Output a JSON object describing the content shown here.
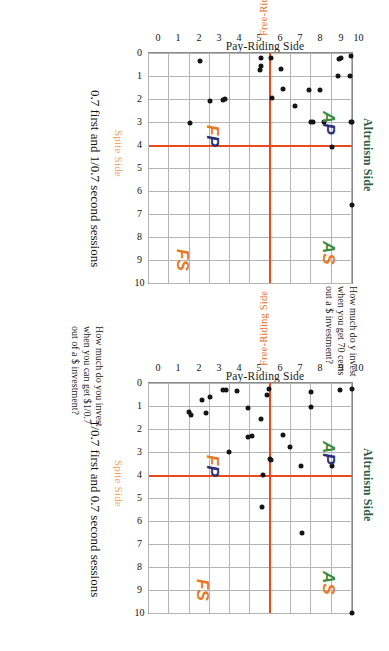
{
  "figure": {
    "type": "scatter-panels",
    "panel_count": 2,
    "background": "#ffffff"
  },
  "colors": {
    "reference_line": "#e8491d",
    "altruism": "#2f5d3f",
    "free_riding": "#e8701c",
    "spite": "#efa26a",
    "quadrant_green": "#3a8a3a",
    "quadrant_blue": "#2b2f77",
    "quadrant_orange": "#e8791f",
    "point": "#151515",
    "gridline": "#b4b4b4"
  },
  "panels": [
    {
      "id": "panel-top",
      "caption": "How much do y invest when you get 70 cents out a $ investment?",
      "subcaption": "0.7 first and 1/0.7 second sessions",
      "axis_titles": {
        "top": "Altruism Side",
        "left": "Pay-Riding Side",
        "bottom_x": "Spite Side",
        "right_y": "Free-Riding Side"
      },
      "quadrant_labels": [
        {
          "name": "AP",
          "first": "A",
          "first_color": "green",
          "second": "P",
          "second_color": "blue"
        },
        {
          "name": "AS",
          "first": "A",
          "first_color": "green",
          "second": "S",
          "second_color": "orange"
        },
        {
          "name": "FP",
          "first": "F",
          "first_color": "orange",
          "second": "P",
          "second_color": "blue"
        },
        {
          "name": "FS",
          "first": "F",
          "first_color": "orange",
          "second": "S",
          "second_color": "orange"
        }
      ],
      "chart_data": {
        "type": "scatter",
        "title": "0.7 first and 1/0.7 second sessions",
        "xlabel": "Spite Side",
        "ylabel": "Free-Riding Side",
        "xlim": [
          0,
          10
        ],
        "ylim": [
          0,
          10
        ],
        "xticks": [
          0,
          1,
          2,
          3,
          4,
          5,
          6,
          7,
          8,
          9,
          10
        ],
        "yticks": [
          0,
          1,
          2,
          3,
          4,
          5,
          6,
          7,
          8,
          9,
          10
        ],
        "grid": true,
        "legend": "none",
        "reference_lines": {
          "x": 4,
          "y": 6
        },
        "points": [
          [
            6.6,
            10.0
          ],
          [
            4.1,
            9.0
          ],
          [
            3.0,
            10.0
          ],
          [
            3.0,
            9.95
          ],
          [
            3.0,
            8.6
          ],
          [
            3.0,
            8.1
          ],
          [
            3.0,
            8.0
          ],
          [
            2.3,
            7.2
          ],
          [
            3.05,
            2.0
          ],
          [
            2.1,
            3.0
          ],
          [
            1.0,
            9.9
          ],
          [
            1.0,
            9.3
          ],
          [
            1.6,
            8.4
          ],
          [
            1.6,
            7.9
          ],
          [
            1.55,
            6.6
          ],
          [
            0.7,
            6.5
          ],
          [
            0.55,
            5.5
          ],
          [
            0.75,
            5.45
          ],
          [
            0.15,
            9.95
          ],
          [
            0.2,
            9.45
          ],
          [
            0.25,
            9.35
          ],
          [
            0.2,
            6.0
          ],
          [
            0.2,
            5.5
          ],
          [
            0.35,
            2.5
          ],
          [
            2.0,
            3.75
          ],
          [
            2.05,
            3.65
          ],
          [
            1.95,
            6.05
          ]
        ]
      }
    },
    {
      "id": "panel-bottom",
      "caption": "How much do you invest when you can get $1/0.7 out of a $ investment?",
      "subcaption": "1/0.7 first and 0.7 second sessions",
      "axis_titles": {
        "top": "Altruism Side",
        "left": "Pay-Riding Side",
        "bottom_x": "Spite Side",
        "right_y": "Free-Riding Side"
      },
      "quadrant_labels": [
        {
          "name": "AP",
          "first": "A",
          "first_color": "green",
          "second": "P",
          "second_color": "blue"
        },
        {
          "name": "AS",
          "first": "A",
          "first_color": "green",
          "second": "S",
          "second_color": "orange"
        },
        {
          "name": "FP",
          "first": "F",
          "first_color": "orange",
          "second": "P",
          "second_color": "blue"
        },
        {
          "name": "FS",
          "first": "F",
          "first_color": "orange",
          "second": "S",
          "second_color": "orange"
        }
      ],
      "chart_data": {
        "type": "scatter",
        "title": "1/0.7 first and 0.7 second sessions",
        "xlabel": "Spite Side",
        "ylabel": "Free-Riding Side",
        "xlim": [
          0,
          10
        ],
        "ylim": [
          0,
          10
        ],
        "xticks": [
          0,
          1,
          2,
          3,
          4,
          5,
          6,
          7,
          8,
          9,
          10
        ],
        "yticks": [
          0,
          1,
          2,
          3,
          4,
          5,
          6,
          7,
          8,
          9,
          10
        ],
        "grid": true,
        "legend": "none",
        "reference_lines": {
          "x": 4,
          "y": 6
        },
        "points": [
          [
            10.0,
            10.0
          ],
          [
            6.5,
            7.55
          ],
          [
            5.4,
            5.55
          ],
          [
            4.0,
            5.6
          ],
          [
            3.6,
            9.0
          ],
          [
            3.6,
            7.5
          ],
          [
            3.35,
            6.0
          ],
          [
            3.3,
            5.95
          ],
          [
            2.8,
            6.95
          ],
          [
            2.25,
            6.6
          ],
          [
            2.3,
            5.05
          ],
          [
            2.35,
            4.9
          ],
          [
            1.55,
            5.5
          ],
          [
            1.05,
            8.0
          ],
          [
            1.1,
            4.9
          ],
          [
            1.3,
            2.8
          ],
          [
            0.4,
            8.0
          ],
          [
            0.25,
            10.0
          ],
          [
            0.3,
            9.4
          ],
          [
            0.25,
            5.9
          ],
          [
            0.5,
            5.8
          ],
          [
            0.35,
            4.35
          ],
          [
            0.3,
            3.8
          ],
          [
            0.3,
            3.65
          ],
          [
            0.75,
            2.6
          ],
          [
            1.4,
            2.05
          ],
          [
            1.25,
            1.95
          ],
          [
            3.0,
            3.95
          ],
          [
            0.6,
            3.0
          ]
        ]
      }
    }
  ]
}
